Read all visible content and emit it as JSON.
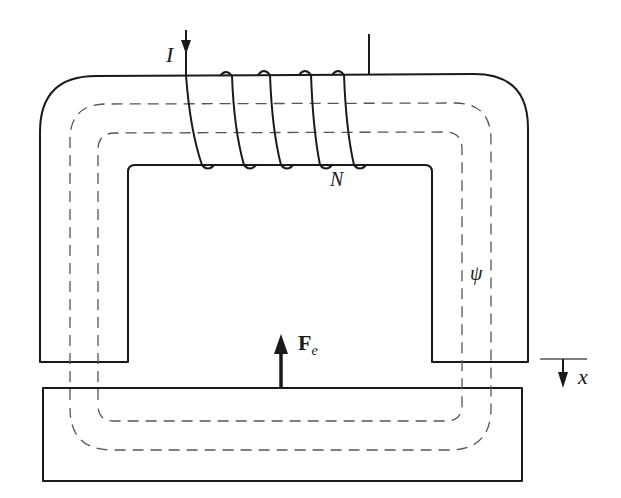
{
  "diagram": {
    "labels": {
      "current": "I",
      "turns": "N",
      "flux": "ψ",
      "force_main": "F",
      "force_sub": "e",
      "displacement": "x"
    },
    "components": [
      {
        "id": "core",
        "description": "U-shaped magnetic core with rounded outer corners"
      },
      {
        "id": "coil",
        "description": "Winding of N turns on core top, 4 visible loops"
      },
      {
        "id": "armature",
        "description": "Rectangular movable armature below core with air gap"
      },
      {
        "id": "flux-path",
        "description": "Dashed flux path lines through core and armature"
      },
      {
        "id": "force-arrow",
        "description": "Upward force arrow F_e on armature"
      },
      {
        "id": "displacement-arrow",
        "description": "Downward arrow marking displacement x"
      }
    ],
    "colors": {
      "line": "#1a1a1a",
      "dashed": "#555555",
      "background": "#ffffff"
    }
  }
}
